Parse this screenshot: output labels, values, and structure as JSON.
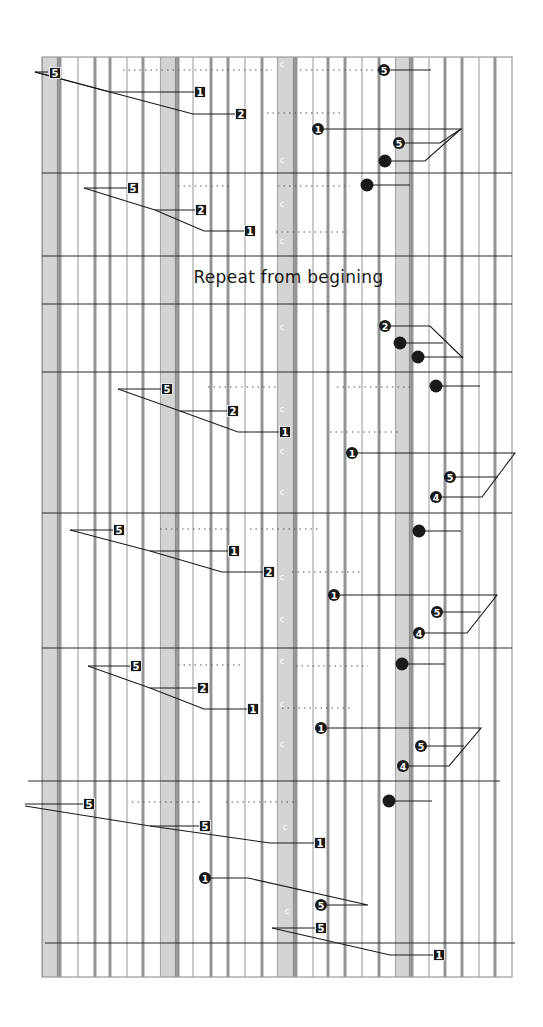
{
  "sheet": {
    "title": "Repeat from begining",
    "grid": {
      "left": 42,
      "right": 512,
      "top": 57,
      "bottom": 977
    },
    "wide_columns": [
      [
        42,
        60
      ],
      [
        160,
        178
      ],
      [
        277,
        296
      ],
      [
        395,
        412
      ]
    ],
    "thin_columns": [
      60,
      78,
      95,
      110,
      127,
      143,
      178,
      193,
      211,
      228,
      245,
      262,
      296,
      313,
      328,
      345,
      362,
      379,
      412,
      429,
      445,
      462,
      479,
      495
    ],
    "measure_lines": [
      57,
      173,
      256,
      304,
      372,
      513,
      648,
      781,
      943,
      977
    ],
    "colors": {
      "wide_column": "#d4d4d4",
      "thin_line": "#a8a8a8",
      "ink": "#1a1a1a",
      "background": "#ffffff"
    },
    "markers": [
      {
        "type": "square",
        "label": "5",
        "x": 55,
        "y": 73
      },
      {
        "type": "square",
        "label": "1",
        "x": 200,
        "y": 92
      },
      {
        "type": "square",
        "label": "2",
        "x": 241,
        "y": 114
      },
      {
        "type": "circle",
        "label": "5",
        "x": 384,
        "y": 70
      },
      {
        "type": "circle",
        "label": "1",
        "x": 318,
        "y": 129
      },
      {
        "type": "circle",
        "label": "5",
        "x": 399,
        "y": 143
      },
      {
        "type": "dot",
        "label": "",
        "x": 385,
        "y": 161
      },
      {
        "type": "dot",
        "label": "",
        "x": 367,
        "y": 185
      },
      {
        "type": "square",
        "label": "5",
        "x": 133,
        "y": 188
      },
      {
        "type": "square",
        "label": "2",
        "x": 201,
        "y": 210
      },
      {
        "type": "square",
        "label": "1",
        "x": 250,
        "y": 231
      },
      {
        "type": "circle",
        "label": "2",
        "x": 385,
        "y": 326
      },
      {
        "type": "dot",
        "label": "",
        "x": 400,
        "y": 343
      },
      {
        "type": "dot",
        "label": "",
        "x": 418,
        "y": 357
      },
      {
        "type": "dot",
        "label": "",
        "x": 436,
        "y": 386
      },
      {
        "type": "square",
        "label": "5",
        "x": 167,
        "y": 389
      },
      {
        "type": "square",
        "label": "2",
        "x": 233,
        "y": 411
      },
      {
        "type": "square",
        "label": "1",
        "x": 285,
        "y": 432
      },
      {
        "type": "circle",
        "label": "1",
        "x": 352,
        "y": 453
      },
      {
        "type": "circle",
        "label": "5",
        "x": 450,
        "y": 477
      },
      {
        "type": "circle",
        "label": "4",
        "x": 436,
        "y": 497
      },
      {
        "type": "square",
        "label": "5",
        "x": 119,
        "y": 530
      },
      {
        "type": "square",
        "label": "1",
        "x": 234,
        "y": 551
      },
      {
        "type": "square",
        "label": "2",
        "x": 269,
        "y": 572
      },
      {
        "type": "dot",
        "label": "",
        "x": 419,
        "y": 531
      },
      {
        "type": "circle",
        "label": "1",
        "x": 334,
        "y": 595
      },
      {
        "type": "circle",
        "label": "5",
        "x": 437,
        "y": 612
      },
      {
        "type": "circle",
        "label": "4",
        "x": 419,
        "y": 633
      },
      {
        "type": "square",
        "label": "5",
        "x": 136,
        "y": 666
      },
      {
        "type": "square",
        "label": "2",
        "x": 203,
        "y": 688
      },
      {
        "type": "square",
        "label": "1",
        "x": 253,
        "y": 709
      },
      {
        "type": "dot",
        "label": "",
        "x": 402,
        "y": 664
      },
      {
        "type": "circle",
        "label": "1",
        "x": 321,
        "y": 728
      },
      {
        "type": "circle",
        "label": "5",
        "x": 421,
        "y": 746
      },
      {
        "type": "circle",
        "label": "4",
        "x": 403,
        "y": 766
      },
      {
        "type": "square",
        "label": "5",
        "x": 89,
        "y": 804
      },
      {
        "type": "square",
        "label": "5",
        "x": 205,
        "y": 826
      },
      {
        "type": "square",
        "label": "1",
        "x": 320,
        "y": 843
      },
      {
        "type": "dot",
        "label": "",
        "x": 389,
        "y": 801
      },
      {
        "type": "circle",
        "label": "1",
        "x": 205,
        "y": 878
      },
      {
        "type": "circle",
        "label": "5",
        "x": 321,
        "y": 905
      },
      {
        "type": "square",
        "label": "5",
        "x": 321,
        "y": 928
      },
      {
        "type": "square",
        "label": "1",
        "x": 439,
        "y": 955
      }
    ],
    "connectors": [
      {
        "points": [
          [
            35,
            72
          ],
          [
            48,
            72
          ]
        ]
      },
      {
        "points": [
          [
            35,
            72
          ],
          [
            110,
            92
          ],
          [
            195,
            92
          ]
        ]
      },
      {
        "points": [
          [
            35,
            72
          ],
          [
            110,
            92
          ],
          [
            193,
            114
          ],
          [
            235,
            114
          ]
        ]
      },
      {
        "points": [
          [
            390,
            70
          ],
          [
            431,
            70
          ]
        ]
      },
      {
        "points": [
          [
            324,
            129
          ],
          [
            461,
            129
          ],
          [
            440,
            143
          ],
          [
            405,
            143
          ]
        ]
      },
      {
        "points": [
          [
            461,
            129
          ],
          [
            425,
            161
          ],
          [
            390,
            161
          ]
        ]
      },
      {
        "points": [
          [
            372,
            185
          ],
          [
            410,
            185
          ]
        ]
      },
      {
        "points": [
          [
            84,
            188
          ],
          [
            127,
            188
          ]
        ]
      },
      {
        "points": [
          [
            84,
            188
          ],
          [
            155,
            210
          ],
          [
            195,
            210
          ]
        ]
      },
      {
        "points": [
          [
            155,
            210
          ],
          [
            204,
            231
          ],
          [
            244,
            231
          ]
        ]
      },
      {
        "points": [
          [
            391,
            326
          ],
          [
            430,
            326
          ],
          [
            463,
            358
          ]
        ]
      },
      {
        "points": [
          [
            405,
            343
          ],
          [
            443,
            343
          ]
        ]
      },
      {
        "points": [
          [
            423,
            357
          ],
          [
            463,
            357
          ]
        ]
      },
      {
        "points": [
          [
            441,
            386
          ],
          [
            480,
            386
          ]
        ]
      },
      {
        "points": [
          [
            118,
            389
          ],
          [
            161,
            389
          ]
        ]
      },
      {
        "points": [
          [
            118,
            389
          ],
          [
            180,
            411
          ],
          [
            227,
            411
          ]
        ]
      },
      {
        "points": [
          [
            180,
            411
          ],
          [
            238,
            432
          ],
          [
            279,
            432
          ]
        ]
      },
      {
        "points": [
          [
            358,
            453
          ],
          [
            515,
            453
          ],
          [
            482,
            497
          ],
          [
            442,
            497
          ]
        ]
      },
      {
        "points": [
          [
            498,
            477
          ],
          [
            456,
            477
          ]
        ]
      },
      {
        "points": [
          [
            70,
            530
          ],
          [
            113,
            530
          ]
        ]
      },
      {
        "points": [
          [
            70,
            530
          ],
          [
            150,
            551
          ],
          [
            228,
            551
          ]
        ]
      },
      {
        "points": [
          [
            150,
            551
          ],
          [
            222,
            572
          ],
          [
            263,
            572
          ]
        ]
      },
      {
        "points": [
          [
            424,
            531
          ],
          [
            461,
            531
          ]
        ]
      },
      {
        "points": [
          [
            340,
            595
          ],
          [
            497,
            595
          ],
          [
            467,
            633
          ],
          [
            425,
            633
          ]
        ]
      },
      {
        "points": [
          [
            481,
            612
          ],
          [
            443,
            612
          ]
        ]
      },
      {
        "points": [
          [
            88,
            666
          ],
          [
            130,
            666
          ]
        ]
      },
      {
        "points": [
          [
            88,
            666
          ],
          [
            150,
            688
          ],
          [
            197,
            688
          ]
        ]
      },
      {
        "points": [
          [
            150,
            688
          ],
          [
            204,
            709
          ],
          [
            247,
            709
          ]
        ]
      },
      {
        "points": [
          [
            407,
            664
          ],
          [
            445,
            664
          ]
        ]
      },
      {
        "points": [
          [
            327,
            728
          ],
          [
            481,
            728
          ],
          [
            449,
            766
          ],
          [
            409,
            766
          ]
        ]
      },
      {
        "points": [
          [
            464,
            746
          ],
          [
            427,
            746
          ]
        ]
      },
      {
        "points": [
          [
            25,
            804
          ],
          [
            83,
            804
          ]
        ]
      },
      {
        "points": [
          [
            25,
            806
          ],
          [
            150,
            826
          ],
          [
            199,
            826
          ]
        ]
      },
      {
        "points": [
          [
            150,
            826
          ],
          [
            270,
            843
          ],
          [
            314,
            843
          ]
        ]
      },
      {
        "points": [
          [
            394,
            801
          ],
          [
            432,
            801
          ]
        ]
      },
      {
        "points": [
          [
            211,
            878
          ],
          [
            248,
            878
          ],
          [
            368,
            905
          ],
          [
            327,
            905
          ]
        ]
      },
      {
        "points": [
          [
            272,
            928
          ],
          [
            315,
            928
          ]
        ]
      },
      {
        "points": [
          [
            272,
            928
          ],
          [
            390,
            955
          ],
          [
            433,
            955
          ]
        ]
      }
    ],
    "dotted_lines": [
      {
        "x1": 123,
        "x2": 272,
        "y": 70
      },
      {
        "x1": 300,
        "x2": 380,
        "y": 70
      },
      {
        "x1": 267,
        "x2": 340,
        "y": 113
      },
      {
        "x1": 178,
        "x2": 232,
        "y": 186
      },
      {
        "x1": 278,
        "x2": 350,
        "y": 186
      },
      {
        "x1": 276,
        "x2": 348,
        "y": 232
      },
      {
        "x1": 208,
        "x2": 278,
        "y": 387
      },
      {
        "x1": 337,
        "x2": 410,
        "y": 387
      },
      {
        "x1": 330,
        "x2": 400,
        "y": 432
      },
      {
        "x1": 160,
        "x2": 230,
        "y": 529
      },
      {
        "x1": 250,
        "x2": 318,
        "y": 529
      },
      {
        "x1": 292,
        "x2": 362,
        "y": 572
      },
      {
        "x1": 178,
        "x2": 244,
        "y": 665
      },
      {
        "x1": 296,
        "x2": 368,
        "y": 666
      },
      {
        "x1": 282,
        "x2": 352,
        "y": 708
      },
      {
        "x1": 132,
        "x2": 200,
        "y": 802
      },
      {
        "x1": 226,
        "x2": 298,
        "y": 802
      }
    ],
    "small_marks": [
      {
        "x": 282,
        "y": 67
      },
      {
        "x": 282,
        "y": 163
      },
      {
        "x": 282,
        "y": 244
      },
      {
        "x": 282,
        "y": 412
      },
      {
        "x": 282,
        "y": 495
      },
      {
        "x": 282,
        "y": 580
      },
      {
        "x": 282,
        "y": 664
      },
      {
        "x": 282,
        "y": 747
      },
      {
        "x": 285,
        "y": 830
      },
      {
        "x": 287,
        "y": 914
      },
      {
        "x": 282,
        "y": 454
      },
      {
        "x": 282,
        "y": 622
      },
      {
        "x": 282,
        "y": 707
      },
      {
        "x": 282,
        "y": 207
      },
      {
        "x": 282,
        "y": 330
      }
    ]
  }
}
